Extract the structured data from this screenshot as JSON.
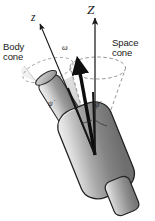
{
  "figure": {
    "kind": "mechanics-diagram",
    "background_color": "#ffffff",
    "labels": {
      "body_cone": "Body\ncone",
      "space_cone": "Space\ncone",
      "body_axis": "z",
      "space_axis": "Z",
      "angular_velocity": "ω",
      "spin_rate": "ψ̇",
      "precession_rate": "φ̇"
    },
    "colors": {
      "ink": "#1a1a1a",
      "dashed_guide": "#8a8a8a",
      "cone_fill_light": "#e8e8e8",
      "cone_fill_mid": "#c9c9c9",
      "body_fill_dark": "#7d7d7d",
      "body_fill_light": "#f2f2f2",
      "outline": "#2b2b2b"
    },
    "geometry": {
      "apex": [
        95,
        155
      ],
      "space_axis_tip": [
        95,
        18
      ],
      "body_axis_tip": [
        40,
        24
      ],
      "omega_tip": [
        77,
        58
      ],
      "space_cone_rim_center": [
        97,
        68
      ],
      "space_cone_rim_rx": 28,
      "space_cone_rim_ry": 11,
      "body_cone_rim_center": [
        48,
        70
      ],
      "body_cone_rim_rx": 26,
      "body_cone_rim_ry": 10.5
    }
  }
}
